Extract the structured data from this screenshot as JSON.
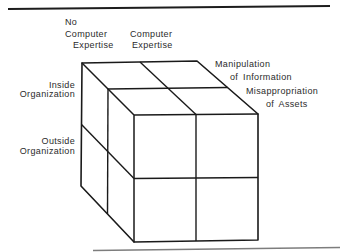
{
  "figure": {
    "kind": "2x2x2 classification cube diagram",
    "labels": {
      "column_left": [
        "No",
        "Computer",
        "Expertise"
      ],
      "column_right": [
        "Computer",
        "Expertise"
      ],
      "row_top": [
        "Inside",
        "Organization"
      ],
      "row_bottom": [
        "Outside",
        "Organization"
      ],
      "depth_back": [
        "Manipulation",
        "of Information"
      ],
      "depth_front": [
        "Misappropriation",
        "of Assets"
      ]
    },
    "colors": {
      "background": "#ffffff",
      "cube_line": "#1a1a1a",
      "label_text": "#2b2b2b",
      "top_rule": "#1c1c1c",
      "bottom_rule": "#7d7d7d"
    }
  }
}
